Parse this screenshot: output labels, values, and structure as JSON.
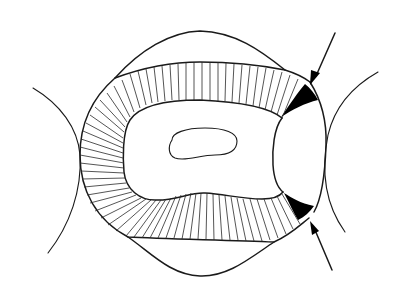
{
  "figure": {
    "subject": "Occlusal cross-section of a tooth between two adjacent teeth with a proximal restoration",
    "labels": [],
    "annotations": [
      {
        "type": "arrow",
        "direction": "down-left",
        "target": "upper-black-margin-gap",
        "description": "Arrow pointing to upper proximal margin gap"
      },
      {
        "type": "arrow",
        "direction": "up-left",
        "target": "lower-black-margin-gap",
        "description": "Arrow pointing to lower proximal margin gap"
      }
    ],
    "elements": {
      "outer_tooth_outline": "Outer crown contour",
      "enamel_band": "Hatched radial band representing enamel/dentin layer",
      "inner_region": "Central dentin region",
      "pulp": "Small oval pulp chamber",
      "restoration": "Proximal restoration on right side",
      "margin_gaps": "Black filled wedge-shaped gaps at restoration margins",
      "adjacent_teeth": "Curved outlines of neighboring teeth on left and right"
    },
    "colors": {
      "line": "#1a1a1a",
      "fill_dark": "#000000",
      "background": "#ffffff"
    }
  }
}
